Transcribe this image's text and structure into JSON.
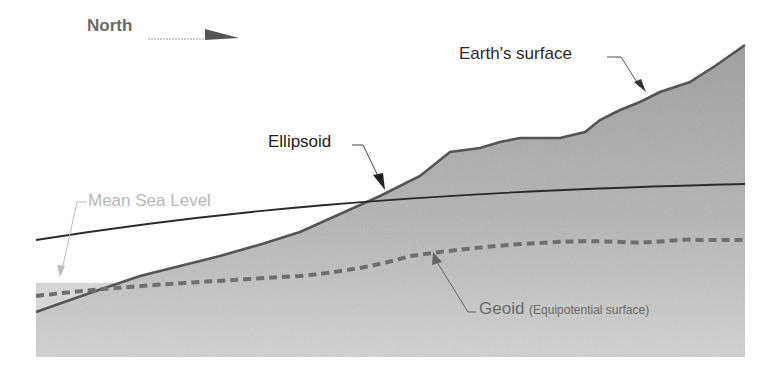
{
  "diagram": {
    "direction_label": "North",
    "labels": {
      "earth_surface": "Earth's surface",
      "ellipsoid": "Ellipsoid",
      "mean_sea_level": "Mean Sea Level",
      "geoid": "Geoid",
      "geoid_note": "(Equipotential surface)"
    },
    "colors": {
      "land_fill": "#a9a9a9",
      "sea_fill": "#d6d6d6",
      "surface_line": "#5a5a5a",
      "ellipsoid_line": "#2b2b2b",
      "geoid_dash": "#6f6f6f",
      "msl_text": "#b8b8b8"
    }
  }
}
